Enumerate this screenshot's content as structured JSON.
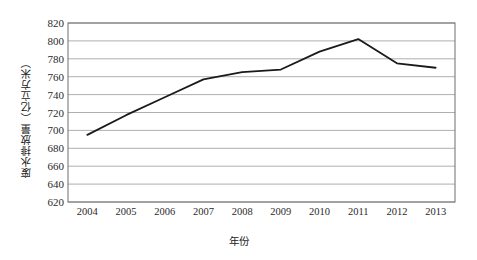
{
  "chart_data": {
    "type": "line",
    "title": "",
    "xlabel": "年份",
    "ylabel": "废水排放量（亿立方米）",
    "categories": [
      "2004",
      "2005",
      "2006",
      "2007",
      "2008",
      "2009",
      "2010",
      "2011",
      "2012",
      "2013"
    ],
    "x": [
      2004,
      2005,
      2006,
      2007,
      2008,
      2009,
      2010,
      2011,
      2012,
      2013
    ],
    "series": [
      {
        "name": "废水排放量",
        "values": [
          695,
          717,
          737,
          757,
          765,
          768,
          788,
          802,
          775,
          770
        ],
        "color": "#1a1a1a"
      }
    ],
    "ylim": [
      620,
      820
    ],
    "yticks": [
      620,
      640,
      660,
      680,
      700,
      720,
      740,
      760,
      780,
      800,
      820
    ],
    "ytick_labels": [
      "620",
      "640",
      "660",
      "680",
      "700",
      "720",
      "740",
      "760",
      "780",
      "800",
      "820"
    ],
    "xtick_labels": [
      "2004",
      "2005",
      "2006",
      "2007",
      "2008",
      "2009",
      "2010",
      "2011",
      "2012",
      "2013"
    ],
    "grid": {
      "horizontal": true,
      "vertical": false,
      "color": "#9a9a9a"
    },
    "legend": {
      "visible": false,
      "position": "none"
    },
    "plot_area": {
      "left": 68,
      "right": 455,
      "top": 23,
      "bottom": 202
    },
    "frame_color": "#6e6e6e",
    "background": "#ffffff"
  }
}
